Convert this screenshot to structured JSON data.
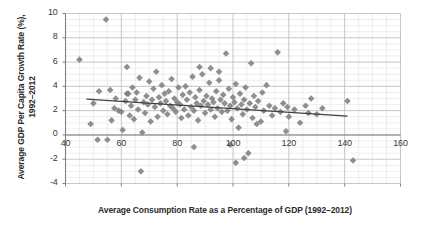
{
  "chart_data": {
    "type": "scatter",
    "title": "",
    "xlabel": "Average Consumption Rate as a Percentage of GDP (1992–2012)",
    "ylabel_line1": "Average GDP Per Capita Growth Rate (%),",
    "ylabel_line2": "1992–2012",
    "xlim": [
      40,
      160
    ],
    "ylim": [
      -4,
      10
    ],
    "xticks": [
      40,
      60,
      80,
      100,
      120,
      140,
      160
    ],
    "yticks": [
      -4,
      -2,
      0,
      2,
      4,
      6,
      8,
      10
    ],
    "grid": "major and minor gridlines, light gray",
    "legend": "none",
    "marker": {
      "shape": "diamond",
      "color": "#808080",
      "size": 5
    },
    "colors": {
      "marker": "#808080",
      "trendline": "#404040",
      "axis": "#808080",
      "major_grid": "#bfbfbf",
      "minor_grid": "#e3e3e3",
      "text": "#3a3a3a"
    },
    "trendline": {
      "type": "linear",
      "x_start": 47.5,
      "y_start": 2.95,
      "x_end": 141.0,
      "y_end": 1.55
    },
    "points": [
      [
        45.0,
        6.2
      ],
      [
        49.0,
        0.9
      ],
      [
        50.0,
        2.6
      ],
      [
        51.5,
        -0.4
      ],
      [
        52.0,
        3.6
      ],
      [
        54.5,
        9.5
      ],
      [
        55.0,
        -0.4
      ],
      [
        56.5,
        1.2
      ],
      [
        57.5,
        2.2
      ],
      [
        58.0,
        3.0
      ],
      [
        59.0,
        2.0
      ],
      [
        60.0,
        1.9
      ],
      [
        60.5,
        0.4
      ],
      [
        61.5,
        2.8
      ],
      [
        62.0,
        5.6
      ],
      [
        62.5,
        3.4
      ],
      [
        63.0,
        1.6
      ],
      [
        63.5,
        2.4
      ],
      [
        64.0,
        3.9
      ],
      [
        64.5,
        1.3
      ],
      [
        65.0,
        2.9
      ],
      [
        65.5,
        3.5
      ],
      [
        66.0,
        2.1
      ],
      [
        66.5,
        4.7
      ],
      [
        67.0,
        -3.0
      ],
      [
        67.5,
        0.2
      ],
      [
        68.0,
        2.7
      ],
      [
        68.5,
        1.8
      ],
      [
        69.0,
        3.2
      ],
      [
        69.5,
        2.5
      ],
      [
        70.0,
        4.4
      ],
      [
        70.5,
        1.1
      ],
      [
        71.0,
        2.9
      ],
      [
        71.5,
        3.8
      ],
      [
        72.0,
        2.3
      ],
      [
        72.5,
        5.2
      ],
      [
        73.0,
        1.5
      ],
      [
        73.5,
        3.1
      ],
      [
        74.0,
        2.6
      ],
      [
        74.5,
        4.1
      ],
      [
        75.0,
        2.0
      ],
      [
        75.5,
        3.4
      ],
      [
        76.0,
        2.8
      ],
      [
        76.5,
        1.7
      ],
      [
        77.0,
        3.6
      ],
      [
        77.5,
        2.4
      ],
      [
        78.0,
        4.6
      ],
      [
        78.5,
        2.2
      ],
      [
        79.0,
        3.0
      ],
      [
        79.5,
        1.9
      ],
      [
        80.0,
        2.7
      ],
      [
        80.5,
        3.9
      ],
      [
        81.0,
        2.5
      ],
      [
        81.5,
        1.4
      ],
      [
        82.0,
        3.3
      ],
      [
        82.5,
        2.1
      ],
      [
        83.0,
        4.0
      ],
      [
        83.5,
        2.9
      ],
      [
        84.0,
        1.6
      ],
      [
        84.5,
        3.5
      ],
      [
        85.0,
        2.3
      ],
      [
        85.5,
        4.8
      ],
      [
        86.0,
        2.0
      ],
      [
        86.5,
        3.1
      ],
      [
        87.0,
        2.6
      ],
      [
        87.5,
        1.2
      ],
      [
        88.0,
        3.7
      ],
      [
        88.5,
        2.4
      ],
      [
        89.0,
        5.0
      ],
      [
        89.5,
        2.8
      ],
      [
        90.0,
        1.8
      ],
      [
        90.5,
        3.2
      ],
      [
        91.0,
        2.5
      ],
      [
        91.5,
        4.3
      ],
      [
        92.0,
        2.1
      ],
      [
        92.5,
        3.0
      ],
      [
        93.0,
        2.7
      ],
      [
        93.5,
        1.5
      ],
      [
        94.0,
        3.6
      ],
      [
        94.5,
        2.2
      ],
      [
        95.0,
        4.5
      ],
      [
        95.5,
        2.9
      ],
      [
        96.0,
        1.9
      ],
      [
        96.5,
        3.3
      ],
      [
        97.0,
        2.6
      ],
      [
        97.5,
        6.7
      ],
      [
        98.0,
        2.0
      ],
      [
        98.5,
        3.8
      ],
      [
        99.0,
        2.4
      ],
      [
        99.5,
        1.3
      ],
      [
        100.0,
        3.1
      ],
      [
        100.5,
        2.7
      ],
      [
        101.0,
        4.2
      ],
      [
        101.5,
        2.2
      ],
      [
        102.0,
        0.6
      ],
      [
        102.5,
        3.4
      ],
      [
        103.0,
        2.5
      ],
      [
        103.5,
        1.7
      ],
      [
        104.0,
        2.9
      ],
      [
        104.5,
        3.9
      ],
      [
        105.0,
        2.1
      ],
      [
        105.5,
        -1.5
      ],
      [
        106.0,
        2.6
      ],
      [
        106.5,
        5.9
      ],
      [
        107.0,
        1.4
      ],
      [
        107.5,
        3.2
      ],
      [
        108.0,
        2.3
      ],
      [
        108.5,
        0.9
      ],
      [
        109.0,
        2.8
      ],
      [
        110.0,
        1.1
      ],
      [
        110.5,
        3.5
      ],
      [
        111.0,
        2.0
      ],
      [
        112.0,
        4.1
      ],
      [
        113.0,
        2.4
      ],
      [
        114.0,
        1.6
      ],
      [
        115.0,
        2.2
      ],
      [
        116.0,
        6.8
      ],
      [
        117.0,
        1.9
      ],
      [
        118.0,
        2.6
      ],
      [
        119.0,
        0.3
      ],
      [
        120.0,
        1.5
      ],
      [
        122.0,
        2.1
      ],
      [
        124.0,
        1.0
      ],
      [
        126.0,
        2.4
      ],
      [
        128.0,
        3.0
      ],
      [
        130.0,
        1.7
      ],
      [
        132.0,
        2.2
      ],
      [
        141.0,
        2.8
      ],
      [
        143.0,
        -2.1
      ],
      [
        86.0,
        -1.0
      ],
      [
        99.0,
        -0.8
      ],
      [
        101.0,
        -2.3
      ],
      [
        104.0,
        -1.9
      ],
      [
        56.0,
        3.7
      ],
      [
        62.0,
        3.4
      ],
      [
        88.0,
        5.6
      ],
      [
        92.0,
        5.5
      ],
      [
        95.0,
        5.2
      ],
      [
        119.5,
        2.3
      ],
      [
        127.0,
        1.8
      ]
    ]
  }
}
